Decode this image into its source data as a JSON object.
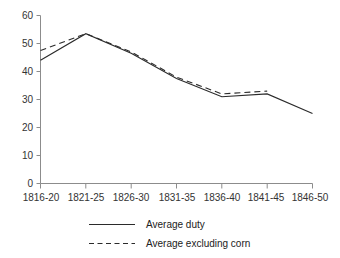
{
  "chart_data": {
    "type": "line",
    "title": "",
    "subtitle": "",
    "xlabel": "",
    "ylabel": "",
    "categories": [
      "1816-20",
      "1821-25",
      "1826-30",
      "1831-35",
      "1836-40",
      "1841-45",
      "1846-50"
    ],
    "ylim": [
      0,
      60
    ],
    "ytick_step": 10,
    "yticks": [
      "0",
      "10",
      "20",
      "30",
      "40",
      "50",
      "60"
    ],
    "grid": false,
    "legend_position": "bottom",
    "series": [
      {
        "name": "Average duty",
        "style": "solid",
        "color": "#2b2b2b",
        "values": [
          44,
          53.5,
          46.5,
          37.5,
          31,
          32,
          25
        ]
      },
      {
        "name": "Average excluding corn",
        "style": "dashed",
        "color": "#2b2b2b",
        "values": [
          47.5,
          53.5,
          47,
          38,
          32,
          33,
          null
        ]
      }
    ],
    "annotations": []
  },
  "legend": {
    "items": [
      {
        "label": "Average duty",
        "style": "solid"
      },
      {
        "label": "Average excluding corn",
        "style": "dashed"
      }
    ]
  },
  "axis": {
    "y_tick_0": "0",
    "y_tick_1": "10",
    "y_tick_2": "20",
    "y_tick_3": "30",
    "y_tick_4": "40",
    "y_tick_5": "50",
    "y_tick_6": "60",
    "x_tick_0": "1816-20",
    "x_tick_1": "1821-25",
    "x_tick_2": "1826-30",
    "x_tick_3": "1831-35",
    "x_tick_4": "1836-40",
    "x_tick_5": "1841-45",
    "x_tick_6": "1846-50"
  },
  "colors": {
    "line": "#2b2b2b",
    "axis": "#8c8c8c",
    "text": "#333333",
    "background": "#ffffff"
  }
}
